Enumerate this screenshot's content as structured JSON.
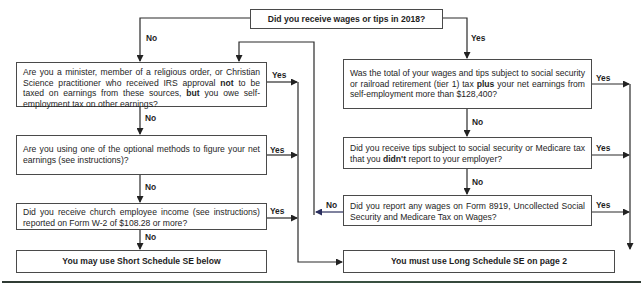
{
  "flowchart": {
    "start": {
      "text": "Did you receive wages or tips in 2018?"
    },
    "left": [
      {
        "pre": "Are you a minister, member of a religious order, or Christian Science practitioner who received IRS approval ",
        "b1": "not",
        "mid": " to be taxed on earnings from these sources, ",
        "b2": "but",
        "post": " you owe self-employment tax on other earnings?"
      },
      {
        "text": "Are you using one of the optional methods to figure your net earnings (see instructions)?"
      },
      {
        "text": "Did you receive church employee income (see instructions) reported on Form  W-2 of $108.28 or more?"
      }
    ],
    "right": [
      {
        "pre": "Was the total of your wages and tips subject to social security or railroad retirement (tier 1) tax ",
        "b1": "plus",
        "post": " your net earnings from self-employment more than $128,400?"
      },
      {
        "pre": "Did you receive tips subject to social security or Medicare tax that you ",
        "b1": "didn't",
        "post": " report to your employer?"
      },
      {
        "text": "Did you report any wages on Form 8919, Uncollected Social Security and Medicare Tax on Wages?"
      }
    ],
    "outcomes": {
      "short": "You may use Short Schedule SE below",
      "long": "You must use Long Schedule SE on page 2"
    },
    "labels": {
      "yes": "Yes",
      "no": "No"
    }
  },
  "colors": {
    "line": "#2a2a2a",
    "feedback_line": "#2b2f5e",
    "rule": "#2f3a33"
  }
}
